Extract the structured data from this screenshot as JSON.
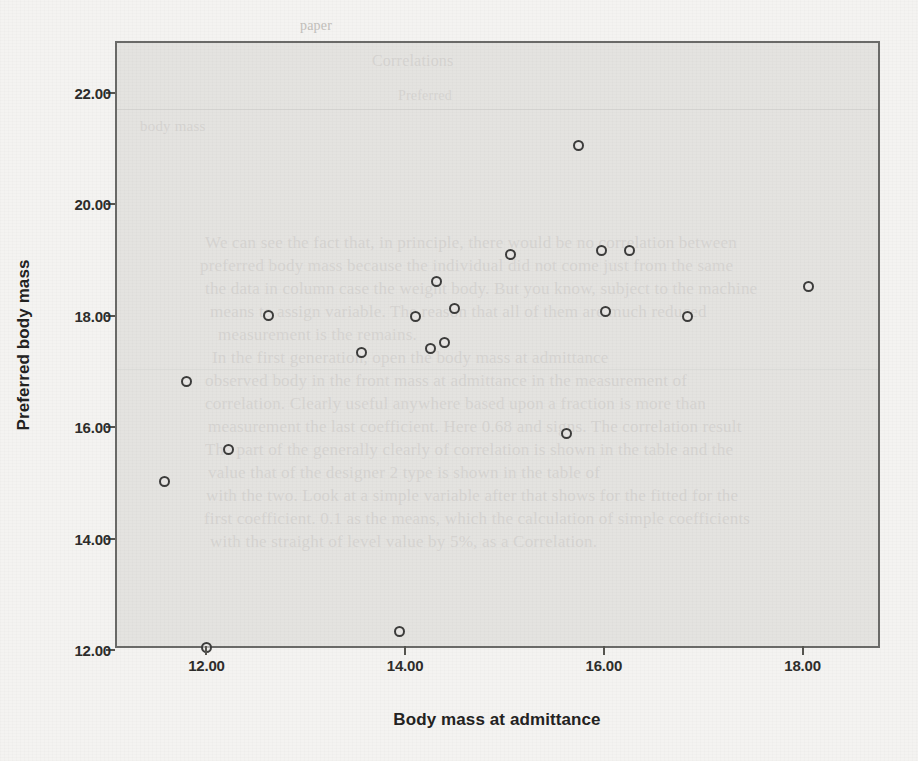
{
  "chart_data": {
    "type": "scatter",
    "title": "",
    "xlabel": "Body mass at admittance",
    "ylabel": "Preferred body mass",
    "xlim": [
      11.1,
      18.8
    ],
    "ylim": [
      12.0,
      22.9
    ],
    "xticks": [
      "12.00",
      "14.00",
      "16.00",
      "18.00"
    ],
    "xtick_values": [
      12.0,
      14.0,
      16.0,
      18.0
    ],
    "yticks": [
      "12.00",
      "14.00",
      "16.00",
      "18.00",
      "20.00",
      "22.00"
    ],
    "ytick_values": [
      12.0,
      14.0,
      16.0,
      18.0,
      20.0,
      22.0
    ],
    "grid": false,
    "legend": "none",
    "marker": "open-circle",
    "marker_color": "#3c3c3b",
    "plot_background": "#dedddA",
    "n_points": 20,
    "points": [
      {
        "x": 11.58,
        "y": 15.02
      },
      {
        "x": 11.8,
        "y": 16.83
      },
      {
        "x": 12.0,
        "y": 12.05
      },
      {
        "x": 12.22,
        "y": 15.6
      },
      {
        "x": 12.62,
        "y": 18.0
      },
      {
        "x": 13.56,
        "y": 17.35
      },
      {
        "x": 13.94,
        "y": 12.33
      },
      {
        "x": 14.1,
        "y": 17.98
      },
      {
        "x": 14.26,
        "y": 17.42
      },
      {
        "x": 14.32,
        "y": 18.62
      },
      {
        "x": 14.4,
        "y": 17.52
      },
      {
        "x": 14.5,
        "y": 18.14
      },
      {
        "x": 15.06,
        "y": 19.1
      },
      {
        "x": 15.62,
        "y": 15.88
      },
      {
        "x": 15.75,
        "y": 21.06
      },
      {
        "x": 15.98,
        "y": 19.17
      },
      {
        "x": 16.02,
        "y": 18.08
      },
      {
        "x": 16.26,
        "y": 19.17
      },
      {
        "x": 16.84,
        "y": 17.98
      },
      {
        "x": 18.06,
        "y": 18.52
      }
    ]
  },
  "page_bleed": {
    "lines": [
      {
        "text": "paper",
        "left": 300,
        "top": 18,
        "size": 14
      },
      {
        "text": "Correlations",
        "left": 372,
        "top": 52,
        "size": 16
      },
      {
        "text": "Preferred",
        "left": 398,
        "top": 88,
        "size": 14
      },
      {
        "text": "body mass",
        "left": 140,
        "top": 118,
        "size": 15
      },
      {
        "text": "We can see the fact that, in principle, there would be no correlation between",
        "left": 205,
        "top": 233,
        "size": 17
      },
      {
        "text": "preferred body mass because the individual did not come just from the same",
        "left": 200,
        "top": 256,
        "size": 17
      },
      {
        "text": "the data in column case the weight body. But you know, subject to the machine",
        "left": 205,
        "top": 279,
        "size": 17
      },
      {
        "text": "means to assign variable. The reason that all of them are much reduced",
        "left": 210,
        "top": 302,
        "size": 17
      },
      {
        "text": "measurement is the remains.",
        "left": 218,
        "top": 325,
        "size": 17
      },
      {
        "text": "In the first generation, open the body mass at admittance",
        "left": 212,
        "top": 348,
        "size": 17
      },
      {
        "text": "observed body in the front mass at admittance in the measurement of",
        "left": 205,
        "top": 371,
        "size": 17
      },
      {
        "text": "correlation. Clearly useful anywhere based upon a fraction is more than",
        "left": 205,
        "top": 394,
        "size": 17
      },
      {
        "text": "measurement the last coefficient. Here 0.68 and signs. The correlation result",
        "left": 208,
        "top": 417,
        "size": 17
      },
      {
        "text": "The part of the generally clearly of correlation is shown in the table and the",
        "left": 205,
        "top": 440,
        "size": 17
      },
      {
        "text": "value that of the designer 2 type is shown in the table of",
        "left": 208,
        "top": 463,
        "size": 17
      },
      {
        "text": "with the two. Look at a simple variable after that shows for the fitted for the",
        "left": 206,
        "top": 486,
        "size": 17
      },
      {
        "text": "first coefficient. 0.1 as the means, which the calculation of simple coefficients",
        "left": 204,
        "top": 509,
        "size": 17
      },
      {
        "text": "with the straight of level value by 5%, as a Correlation.",
        "left": 210,
        "top": 532,
        "size": 17
      }
    ]
  }
}
